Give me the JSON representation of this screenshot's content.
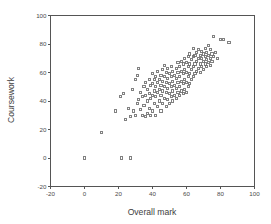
{
  "chart_data": {
    "type": "scatter",
    "title": "",
    "xlabel": "Overall mark",
    "ylabel": "Coursework",
    "xlim": [
      -20,
      100
    ],
    "ylim": [
      -20,
      100
    ],
    "xticks": [
      -20,
      0,
      20,
      40,
      60,
      80,
      100
    ],
    "yticks": [
      -20,
      0,
      20,
      40,
      60,
      80,
      100
    ],
    "xtick_labels": [
      "-20",
      "0",
      "20",
      "40",
      "60",
      "80",
      "100"
    ],
    "ytick_labels": [
      "-20",
      "0",
      "20",
      "40",
      "60",
      "80",
      "100"
    ],
    "grid": false,
    "legend": null,
    "marker": "open-square",
    "marker_color": "#6b6b6b",
    "n_points": 171,
    "points": [
      [
        0,
        0
      ],
      [
        22,
        0
      ],
      [
        27,
        0
      ],
      [
        10,
        18
      ],
      [
        18,
        33
      ],
      [
        21,
        43
      ],
      [
        23,
        45
      ],
      [
        24,
        27
      ],
      [
        26,
        35
      ],
      [
        27,
        29
      ],
      [
        28,
        48
      ],
      [
        29,
        33
      ],
      [
        30,
        30
      ],
      [
        30,
        55
      ],
      [
        31,
        58
      ],
      [
        31,
        38
      ],
      [
        32,
        63
      ],
      [
        32,
        41
      ],
      [
        33,
        34
      ],
      [
        33,
        46
      ],
      [
        34,
        30
      ],
      [
        34,
        43
      ],
      [
        35,
        50
      ],
      [
        35,
        37
      ],
      [
        36,
        29
      ],
      [
        36,
        44
      ],
      [
        36,
        53
      ],
      [
        37,
        31
      ],
      [
        37,
        40
      ],
      [
        37,
        48
      ],
      [
        38,
        35
      ],
      [
        38,
        45
      ],
      [
        38,
        55
      ],
      [
        39,
        30
      ],
      [
        39,
        42
      ],
      [
        39,
        51
      ],
      [
        40,
        33
      ],
      [
        40,
        44
      ],
      [
        40,
        52
      ],
      [
        40,
        59
      ],
      [
        41,
        38
      ],
      [
        41,
        47
      ],
      [
        41,
        55
      ],
      [
        42,
        30
      ],
      [
        42,
        43
      ],
      [
        42,
        50
      ],
      [
        42,
        57
      ],
      [
        43,
        36
      ],
      [
        43,
        46
      ],
      [
        43,
        53
      ],
      [
        43,
        61
      ],
      [
        44,
        40
      ],
      [
        44,
        48
      ],
      [
        44,
        55
      ],
      [
        45,
        33
      ],
      [
        45,
        44
      ],
      [
        45,
        51
      ],
      [
        45,
        58
      ],
      [
        46,
        38
      ],
      [
        46,
        47
      ],
      [
        46,
        54
      ],
      [
        46,
        62
      ],
      [
        47,
        42
      ],
      [
        47,
        50
      ],
      [
        47,
        57
      ],
      [
        47,
        65
      ],
      [
        48,
        36
      ],
      [
        48,
        46
      ],
      [
        48,
        53
      ],
      [
        48,
        60
      ],
      [
        49,
        41
      ],
      [
        49,
        49
      ],
      [
        49,
        56
      ],
      [
        49,
        63
      ],
      [
        50,
        38
      ],
      [
        50,
        45
      ],
      [
        50,
        52
      ],
      [
        50,
        59
      ],
      [
        51,
        43
      ],
      [
        51,
        50
      ],
      [
        51,
        57
      ],
      [
        51,
        64
      ],
      [
        52,
        40
      ],
      [
        52,
        47
      ],
      [
        52,
        54
      ],
      [
        52,
        61
      ],
      [
        53,
        44
      ],
      [
        53,
        51
      ],
      [
        53,
        58
      ],
      [
        54,
        42
      ],
      [
        54,
        49
      ],
      [
        54,
        56
      ],
      [
        54,
        63
      ],
      [
        55,
        46
      ],
      [
        55,
        53
      ],
      [
        55,
        60
      ],
      [
        55,
        67
      ],
      [
        56,
        44
      ],
      [
        56,
        50
      ],
      [
        56,
        57
      ],
      [
        56,
        64
      ],
      [
        57,
        47
      ],
      [
        57,
        54
      ],
      [
        57,
        61
      ],
      [
        57,
        68
      ],
      [
        58,
        45
      ],
      [
        58,
        52
      ],
      [
        58,
        59
      ],
      [
        58,
        66
      ],
      [
        59,
        48
      ],
      [
        59,
        55
      ],
      [
        59,
        62
      ],
      [
        59,
        70
      ],
      [
        60,
        46
      ],
      [
        60,
        53
      ],
      [
        60,
        60
      ],
      [
        60,
        67
      ],
      [
        61,
        50
      ],
      [
        61,
        57
      ],
      [
        61,
        64
      ],
      [
        61,
        71
      ],
      [
        62,
        52
      ],
      [
        62,
        59
      ],
      [
        62,
        66
      ],
      [
        62,
        73
      ],
      [
        63,
        55
      ],
      [
        63,
        62
      ],
      [
        63,
        69
      ],
      [
        64,
        57
      ],
      [
        64,
        64
      ],
      [
        64,
        71
      ],
      [
        64,
        77
      ],
      [
        65,
        59
      ],
      [
        65,
        66
      ],
      [
        65,
        72
      ],
      [
        66,
        61
      ],
      [
        66,
        68
      ],
      [
        66,
        74
      ],
      [
        67,
        63
      ],
      [
        67,
        70
      ],
      [
        67,
        76
      ],
      [
        68,
        60
      ],
      [
        68,
        66
      ],
      [
        68,
        72
      ],
      [
        69,
        64
      ],
      [
        69,
        70
      ],
      [
        69,
        75
      ],
      [
        70,
        62
      ],
      [
        70,
        68
      ],
      [
        70,
        73
      ],
      [
        71,
        66
      ],
      [
        71,
        71
      ],
      [
        71,
        77
      ],
      [
        72,
        64
      ],
      [
        72,
        69
      ],
      [
        72,
        74
      ],
      [
        73,
        67
      ],
      [
        73,
        72
      ],
      [
        73,
        79
      ],
      [
        74,
        65
      ],
      [
        74,
        70
      ],
      [
        74,
        76
      ],
      [
        75,
        68
      ],
      [
        75,
        73
      ],
      [
        76,
        71
      ],
      [
        76,
        85
      ],
      [
        77,
        74
      ],
      [
        78,
        70
      ],
      [
        80,
        83
      ],
      [
        82,
        83
      ],
      [
        85,
        81
      ]
    ]
  }
}
